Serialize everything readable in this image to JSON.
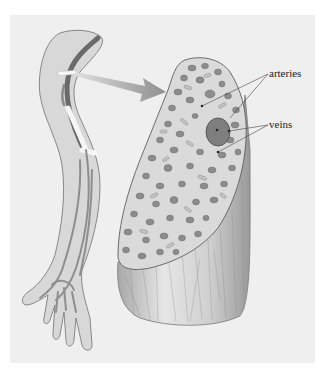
{
  "figure": {
    "background_color": "#efefef",
    "labels": {
      "arteries": "arteries",
      "veins": "veins"
    },
    "colors": {
      "arm_fill": "#d6d6d6",
      "arm_outline": "#7a7a7a",
      "vessel": "#8a8a8a",
      "nerve_dark": "#6a6a6a",
      "arrow": "#9a9a9a",
      "section_fill": "#dcdcdc",
      "fiber": "#8c8c8c",
      "fiber_light": "#c2c2c2",
      "large_vessel": "#7e7e7e",
      "bundle_side": "#c8c8c8"
    }
  }
}
